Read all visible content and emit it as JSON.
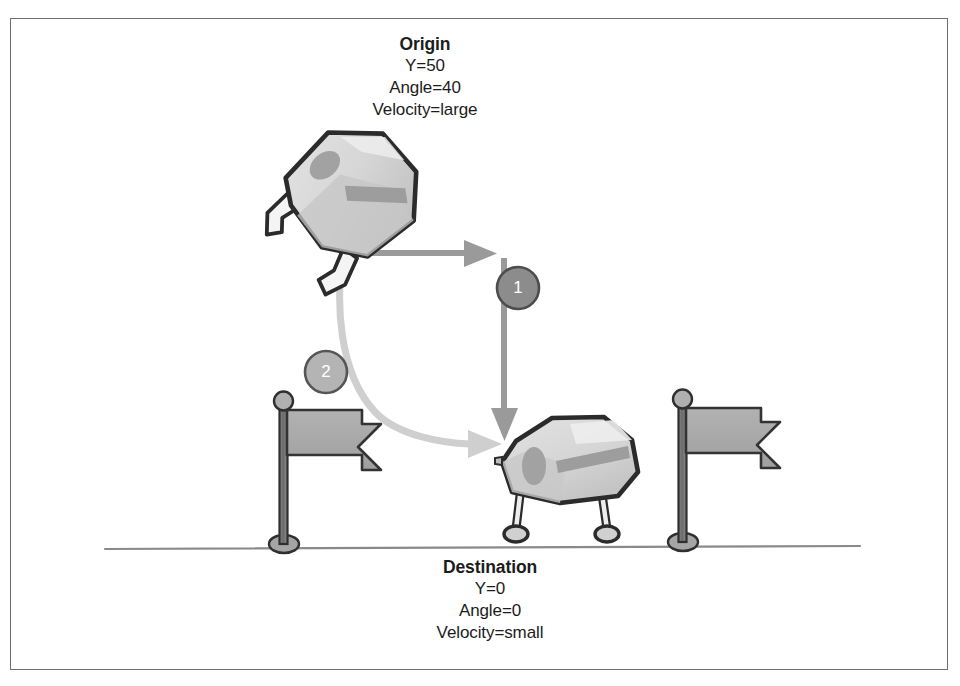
{
  "figure": {
    "kind": "physics-state-diagram",
    "border_color": "#6e6e6e",
    "background_color": "#ffffff"
  },
  "origin": {
    "title": "Origin",
    "lines": [
      "Y=50",
      "Angle=40",
      "Velocity=large"
    ],
    "y_value": "Y=50",
    "angle_value": "Angle=40",
    "velocity_value": "Velocity=large"
  },
  "destination": {
    "title": "Destination",
    "lines": [
      "Y=0",
      "Angle=0",
      "Velocity=small"
    ],
    "y_value": "Y=0",
    "angle_value": "Angle=0",
    "velocity_value": "Velocity=small"
  },
  "badges": [
    {
      "number": "1",
      "fill": "#8c8c8c",
      "stroke": "#4d4d4d"
    },
    {
      "number": "2",
      "fill": "#b4b4b4",
      "stroke": "#555555"
    }
  ],
  "arrows": {
    "path_one": {
      "label": "1",
      "color": "#9a9a9a",
      "description": "right then down, right-angle path"
    },
    "path_two": {
      "label": "2",
      "color": "#cacaca",
      "description": "smooth curved arc"
    }
  },
  "icons": {
    "origin_creature": "tumbling-creature-icon",
    "destination_creature": "standing-creature-icon",
    "flag_left": "flag-icon",
    "flag_right": "flag-icon",
    "ground": "ground-line"
  },
  "colors": {
    "creature_body": "#d8d8d8",
    "creature_outline": "#2b2b2b",
    "creature_shade": "#b8b8b8",
    "flag_fill": "#a9a9a9",
    "flag_outline": "#333333",
    "ground_line": "#8a8a8a",
    "text": "#1c1c1c"
  }
}
